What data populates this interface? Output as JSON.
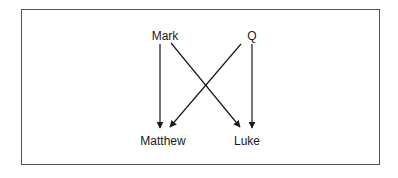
{
  "diagram": {
    "type": "directed-graph",
    "nodes": [
      {
        "id": "mark",
        "label": "Mark",
        "x": 165,
        "y": 36
      },
      {
        "id": "q",
        "label": "Q",
        "x": 252,
        "y": 36
      },
      {
        "id": "matthew",
        "label": "Matthew",
        "x": 163,
        "y": 141
      },
      {
        "id": "luke",
        "label": "Luke",
        "x": 247,
        "y": 141
      }
    ],
    "edges": [
      {
        "from": "mark",
        "to": "matthew",
        "x1": 160,
        "y1": 44,
        "x2": 160,
        "y2": 128
      },
      {
        "from": "mark",
        "to": "luke",
        "x1": 171,
        "y1": 43,
        "x2": 240,
        "y2": 127
      },
      {
        "from": "q",
        "to": "matthew",
        "x1": 241,
        "y1": 44,
        "x2": 170,
        "y2": 127
      },
      {
        "from": "q",
        "to": "luke",
        "x1": 252,
        "y1": 44,
        "x2": 252,
        "y2": 128
      }
    ],
    "colors": {
      "line": "#1a1a1a",
      "border": "#555555",
      "background": "#ffffff"
    }
  }
}
